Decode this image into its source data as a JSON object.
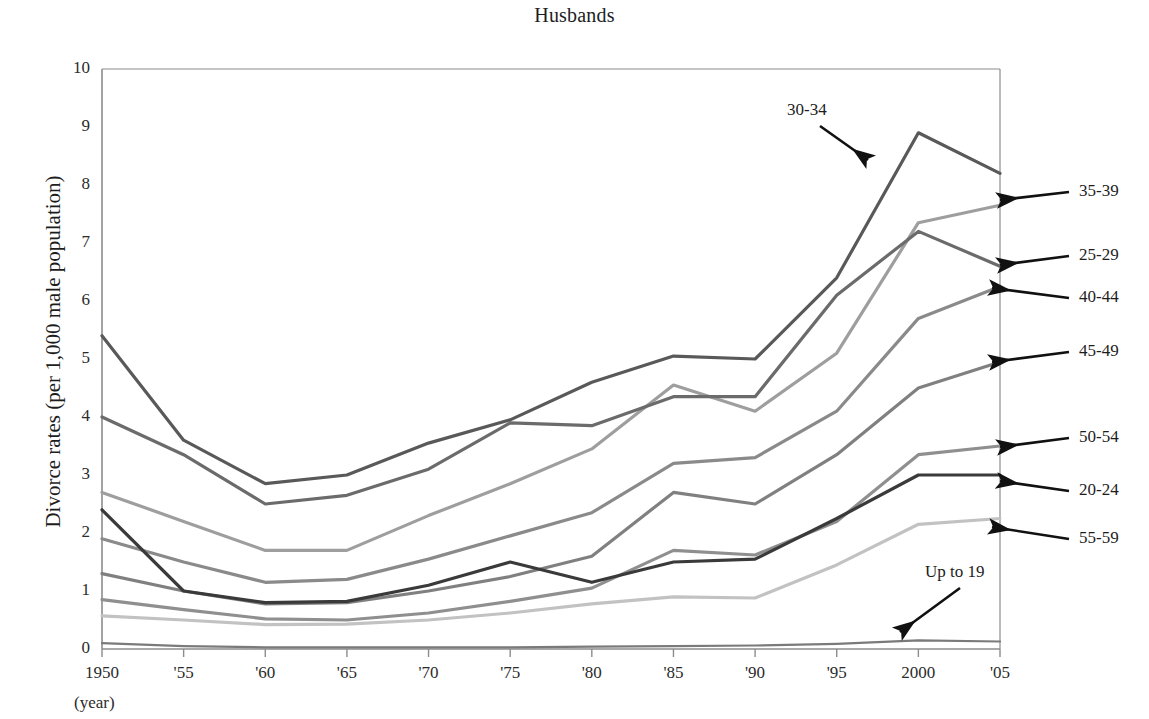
{
  "chart_data": {
    "type": "line",
    "title": "Husbands",
    "xlabel": "(year)",
    "ylabel": "Divorce rates (per 1,000 male population)",
    "x": [
      1950,
      1955,
      1960,
      1965,
      1970,
      1975,
      1980,
      1985,
      1990,
      1995,
      2000,
      2005
    ],
    "xtick_labels": [
      "1950",
      "'55",
      "'60",
      "'65",
      "'70",
      "'75",
      "'80",
      "'85",
      "'90",
      "'95",
      "2000",
      "'05"
    ],
    "ytick_labels": [
      "0",
      "1",
      "2",
      "3",
      "4",
      "5",
      "6",
      "7",
      "8",
      "9",
      "10"
    ],
    "ylim": [
      0,
      10
    ],
    "xlim": [
      1950,
      2005
    ],
    "grid": false,
    "legend_position": "right-arrows",
    "series": [
      {
        "name": "30-34",
        "color": "#595959",
        "width": 3.2,
        "label_mode": "annotation",
        "values": [
          5.4,
          3.6,
          2.85,
          3.0,
          3.55,
          3.95,
          4.6,
          5.05,
          5.0,
          6.4,
          8.9,
          8.2
        ]
      },
      {
        "name": "35-39",
        "color": "#9e9e9e",
        "width": 3.2,
        "label_mode": "arrow",
        "values": [
          2.7,
          2.2,
          1.7,
          1.7,
          2.3,
          2.85,
          3.45,
          4.55,
          4.1,
          5.1,
          7.35,
          7.65
        ]
      },
      {
        "name": "25-29",
        "color": "#6b6b6b",
        "width": 3.2,
        "label_mode": "arrow",
        "values": [
          4.0,
          3.35,
          2.5,
          2.65,
          3.1,
          3.9,
          3.85,
          4.35,
          4.35,
          6.1,
          7.2,
          6.6
        ]
      },
      {
        "name": "40-44",
        "color": "#8a8a8a",
        "width": 3.2,
        "label_mode": "arrow",
        "values": [
          1.9,
          1.5,
          1.15,
          1.2,
          1.55,
          1.95,
          2.35,
          3.2,
          3.3,
          4.1,
          5.7,
          6.25
        ]
      },
      {
        "name": "45-49",
        "color": "#808080",
        "width": 3.2,
        "label_mode": "arrow",
        "values": [
          1.3,
          1.0,
          0.78,
          0.8,
          1.0,
          1.25,
          1.6,
          2.7,
          2.5,
          3.35,
          4.5,
          4.95
        ]
      },
      {
        "name": "50-54",
        "color": "#8f8f8f",
        "width": 3.2,
        "label_mode": "arrow",
        "values": [
          0.85,
          0.68,
          0.52,
          0.5,
          0.62,
          0.82,
          1.05,
          1.7,
          1.62,
          2.2,
          3.35,
          3.5
        ]
      },
      {
        "name": "20-24",
        "color": "#3a3a3a",
        "width": 3.2,
        "label_mode": "arrow",
        "values": [
          2.4,
          1.0,
          0.8,
          0.82,
          1.1,
          1.5,
          1.15,
          1.5,
          1.55,
          2.25,
          3.0,
          3.0
        ]
      },
      {
        "name": "55-59",
        "color": "#c2c2c2",
        "width": 3.2,
        "label_mode": "arrow",
        "values": [
          0.57,
          0.5,
          0.42,
          0.43,
          0.5,
          0.62,
          0.78,
          0.9,
          0.88,
          1.45,
          2.15,
          2.25
        ]
      },
      {
        "name": "Up to 19",
        "color": "#7a7a7a",
        "width": 2.2,
        "label_mode": "annotation",
        "values": [
          0.1,
          0.05,
          0.03,
          0.03,
          0.03,
          0.03,
          0.04,
          0.05,
          0.06,
          0.09,
          0.15,
          0.13
        ]
      }
    ]
  },
  "annotations": [
    {
      "name": "annotation-30-34",
      "text": "30-34",
      "text_x": 787,
      "text_y": 100,
      "arrow_x1": 820,
      "arrow_y1": 126,
      "arrow_x2": 868,
      "arrow_y2": 160
    },
    {
      "name": "annotation-up-to-19",
      "text": "Up to 19",
      "text_x": 925,
      "text_y": 562,
      "arrow_x1": 960,
      "arrow_y1": 588,
      "arrow_x2": 900,
      "arrow_y2": 632
    }
  ],
  "legend_arrows": [
    {
      "name": "35-39",
      "text": "35-39",
      "label_x": 1079,
      "label_y": 181,
      "arrow_x1": 1069,
      "arrow_y1": 192,
      "arrow_x2": 1000,
      "arrow_y2": 200
    },
    {
      "name": "25-29",
      "text": "25-29",
      "label_x": 1079,
      "label_y": 245,
      "arrow_x1": 1069,
      "arrow_y1": 256,
      "arrow_x2": 1000,
      "arrow_y2": 265
    },
    {
      "name": "40-44",
      "text": "40-44",
      "label_x": 1079,
      "label_y": 287,
      "arrow_x1": 1069,
      "arrow_y1": 298,
      "arrow_x2": 992,
      "arrow_y2": 288
    },
    {
      "name": "45-49",
      "text": "45-49",
      "label_x": 1079,
      "label_y": 341,
      "arrow_x1": 1069,
      "arrow_y1": 352,
      "arrow_x2": 992,
      "arrow_y2": 362
    },
    {
      "name": "50-54",
      "text": "50-54",
      "label_x": 1079,
      "label_y": 427,
      "arrow_x1": 1069,
      "arrow_y1": 438,
      "arrow_x2": 1000,
      "arrow_y2": 447
    },
    {
      "name": "20-24",
      "text": "20-24",
      "label_x": 1079,
      "label_y": 480,
      "arrow_x1": 1069,
      "arrow_y1": 491,
      "arrow_x2": 1000,
      "arrow_y2": 481
    },
    {
      "name": "55-59",
      "text": "55-59",
      "label_x": 1079,
      "label_y": 528,
      "arrow_x1": 1069,
      "arrow_y1": 539,
      "arrow_x2": 992,
      "arrow_y2": 527
    }
  ],
  "axes": {
    "plot_left": 102,
    "plot_right": 1000,
    "plot_top": 69,
    "plot_bottom": 649,
    "axis_color": "#8c8c8c",
    "year_note": "(year)"
  }
}
